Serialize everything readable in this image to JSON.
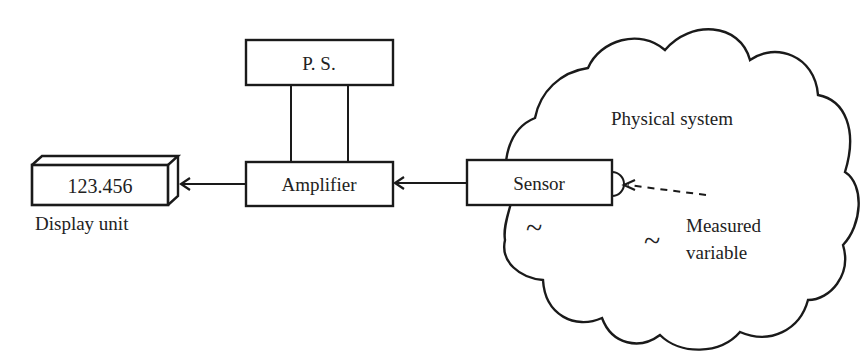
{
  "diagram": {
    "colors": {
      "stroke": "#1a1a1a",
      "text": "#222222",
      "background": "#ffffff"
    },
    "blocks": {
      "display": {
        "value": "123.456",
        "caption": "Display unit"
      },
      "amplifier": {
        "label": "Amplifier"
      },
      "power_supply": {
        "label": "P. S."
      },
      "sensor": {
        "label": "Sensor"
      }
    },
    "region": {
      "label": "Physical system"
    },
    "measured_variable": {
      "line1": "Measured",
      "line2": "variable"
    },
    "symbols": {
      "tilde": "~"
    },
    "connections": [
      {
        "from": "sensor",
        "to": "amplifier",
        "style": "solid-arrow"
      },
      {
        "from": "amplifier",
        "to": "display",
        "style": "solid-arrow"
      },
      {
        "from": "power_supply",
        "to": "amplifier",
        "style": "two-wire"
      },
      {
        "from": "measured_variable",
        "to": "sensor",
        "style": "dashed-arrow"
      }
    ]
  }
}
